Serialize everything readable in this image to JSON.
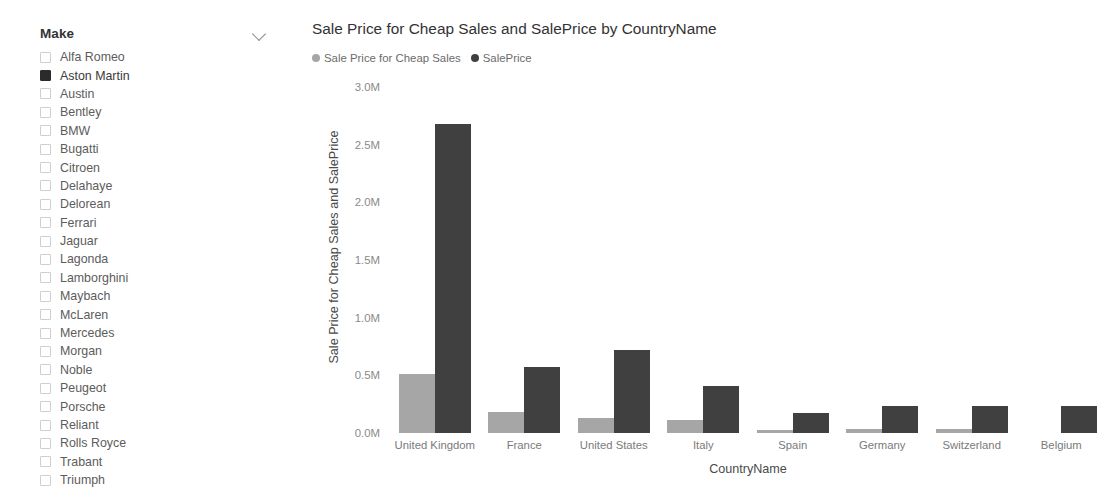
{
  "slicer": {
    "title": "Make",
    "expand_icon": "chevron-down-icon",
    "items": [
      {
        "label": "Alfa Romeo",
        "checked": false
      },
      {
        "label": "Aston Martin",
        "checked": true
      },
      {
        "label": "Austin",
        "checked": false
      },
      {
        "label": "Bentley",
        "checked": false
      },
      {
        "label": "BMW",
        "checked": false
      },
      {
        "label": "Bugatti",
        "checked": false
      },
      {
        "label": "Citroen",
        "checked": false
      },
      {
        "label": "Delahaye",
        "checked": false
      },
      {
        "label": "Delorean",
        "checked": false
      },
      {
        "label": "Ferrari",
        "checked": false
      },
      {
        "label": "Jaguar",
        "checked": false
      },
      {
        "label": "Lagonda",
        "checked": false
      },
      {
        "label": "Lamborghini",
        "checked": false
      },
      {
        "label": "Maybach",
        "checked": false
      },
      {
        "label": "McLaren",
        "checked": false
      },
      {
        "label": "Mercedes",
        "checked": false
      },
      {
        "label": "Morgan",
        "checked": false
      },
      {
        "label": "Noble",
        "checked": false
      },
      {
        "label": "Peugeot",
        "checked": false
      },
      {
        "label": "Porsche",
        "checked": false
      },
      {
        "label": "Reliant",
        "checked": false
      },
      {
        "label": "Rolls Royce",
        "checked": false
      },
      {
        "label": "Trabant",
        "checked": false
      },
      {
        "label": "Triumph",
        "checked": false
      }
    ]
  },
  "chart_data": {
    "type": "bar",
    "title": "Sale Price for Cheap Sales and SalePrice by CountryName",
    "xlabel": "CountryName",
    "ylabel": "Sale Price for Cheap Sales and SalePrice",
    "categories": [
      "United Kingdom",
      "France",
      "United States",
      "Italy",
      "Spain",
      "Germany",
      "Switzerland",
      "Belgium"
    ],
    "series": [
      {
        "name": "Sale Price for Cheap Sales",
        "color": "#a6a6a6",
        "values": [
          510000,
          180000,
          130000,
          110000,
          30000,
          35000,
          35000,
          0
        ]
      },
      {
        "name": "SalePrice",
        "color": "#404040",
        "values": [
          2680000,
          570000,
          720000,
          405000,
          170000,
          230000,
          235000,
          230000
        ]
      }
    ],
    "ylim": [
      0,
      3000000
    ],
    "ytick_values": [
      0,
      500000,
      1000000,
      1500000,
      2000000,
      2500000,
      3000000
    ],
    "ytick_labels": [
      "0.0M",
      "0.5M",
      "1.0M",
      "1.5M",
      "2.0M",
      "2.5M",
      "3.0M"
    ],
    "grid": false,
    "legend_position": "top-left"
  }
}
